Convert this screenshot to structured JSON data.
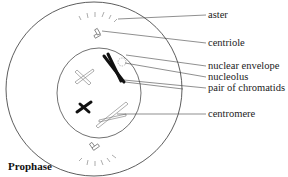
{
  "diagram": {
    "title": "Prophase",
    "labels": [
      {
        "id": "aster",
        "text": "aster"
      },
      {
        "id": "centriole",
        "text": "centriole"
      },
      {
        "id": "nuclear-envelope",
        "text": "nuclear envelope"
      },
      {
        "id": "nucleolus",
        "text": "nucleolus"
      },
      {
        "id": "pair-of-chromatids",
        "text": "pair of chromatids"
      },
      {
        "id": "centromere",
        "text": "centromere"
      }
    ],
    "colors": {
      "line": "#333333",
      "chromosome_dark": "#111111",
      "chromosome_light": "#777777",
      "background": "#ffffff"
    }
  }
}
